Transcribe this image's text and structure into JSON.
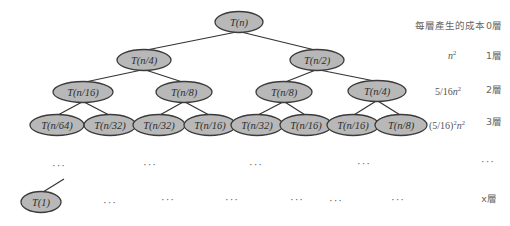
{
  "diagram": {
    "node_fill": "#b8b8b8",
    "node_stroke": "#3a3a3a",
    "edge_color": "#333333",
    "nodes": [
      {
        "id": "root",
        "label": "T(n)",
        "x": 239,
        "y": 22,
        "rx": 24,
        "ry": 10.5
      },
      {
        "id": "l1a",
        "label": "T(n/4)",
        "x": 144,
        "y": 60,
        "rx": 27,
        "ry": 10.5
      },
      {
        "id": "l1b",
        "label": "T(n/2)",
        "x": 317,
        "y": 60,
        "rx": 27,
        "ry": 10.5
      },
      {
        "id": "l2a",
        "label": "T(n/16)",
        "x": 83,
        "y": 92,
        "rx": 30,
        "ry": 10.5
      },
      {
        "id": "l2b",
        "label": "T(n/8)",
        "x": 184,
        "y": 92,
        "rx": 28,
        "ry": 10.5
      },
      {
        "id": "l2c",
        "label": "T(n/8)",
        "x": 284,
        "y": 92,
        "rx": 28,
        "ry": 10.5
      },
      {
        "id": "l2d",
        "label": "T(n/4)",
        "x": 377,
        "y": 91,
        "rx": 29,
        "ry": 10.5
      },
      {
        "id": "l3a",
        "label": "T(n/64)",
        "x": 57,
        "y": 125,
        "rx": 27,
        "ry": 10.5
      },
      {
        "id": "l3b",
        "label": "T(n/32)",
        "x": 110,
        "y": 125,
        "rx": 26,
        "ry": 10.5
      },
      {
        "id": "l3c",
        "label": "T(n/32)",
        "x": 159,
        "y": 125,
        "rx": 26,
        "ry": 10.5
      },
      {
        "id": "l3d",
        "label": "T(n/16)",
        "x": 210,
        "y": 125,
        "rx": 26,
        "ry": 10.5
      },
      {
        "id": "l3e",
        "label": "T(n/32)",
        "x": 257,
        "y": 125,
        "rx": 26,
        "ry": 10.5
      },
      {
        "id": "l3f",
        "label": "T(n/16)",
        "x": 306,
        "y": 125,
        "rx": 26,
        "ry": 10.5
      },
      {
        "id": "l3g",
        "label": "T(n/16)",
        "x": 353,
        "y": 125,
        "rx": 26,
        "ry": 10.5
      },
      {
        "id": "l3h",
        "label": "T(n/8)",
        "x": 401,
        "y": 125,
        "rx": 26,
        "ry": 10.5
      },
      {
        "id": "leaf",
        "label": "T(1)",
        "x": 41,
        "y": 202,
        "rx": 20,
        "ry": 10.5
      }
    ],
    "edges": [
      {
        "from": "root",
        "to": "l1a"
      },
      {
        "from": "root",
        "to": "l1b"
      },
      {
        "from": "l1a",
        "to": "l2a"
      },
      {
        "from": "l1a",
        "to": "l2b"
      },
      {
        "from": "l1b",
        "to": "l2c"
      },
      {
        "from": "l1b",
        "to": "l2d"
      },
      {
        "from": "l2a",
        "to": "l3a"
      },
      {
        "from": "l2a",
        "to": "l3b"
      },
      {
        "from": "l2b",
        "to": "l3c"
      },
      {
        "from": "l2b",
        "to": "l3d"
      },
      {
        "from": "l2c",
        "to": "l3e"
      },
      {
        "from": "l2c",
        "to": "l3f"
      },
      {
        "from": "l2d",
        "to": "l3g"
      },
      {
        "from": "l2d",
        "to": "l3h"
      }
    ],
    "leaf_edge": {
      "x1": 64,
      "y1": 179,
      "x2": 43,
      "y2": 192
    },
    "ellipsis_text": "···",
    "ellipsis_row1": [
      {
        "x": 59,
        "y": 169
      },
      {
        "x": 150,
        "y": 168
      },
      {
        "x": 256,
        "y": 168
      },
      {
        "x": 364,
        "y": 167
      },
      {
        "x": 488,
        "y": 165
      }
    ],
    "ellipsis_row2": [
      {
        "x": 110,
        "y": 206
      },
      {
        "x": 168,
        "y": 203
      },
      {
        "x": 232,
        "y": 203
      },
      {
        "x": 297,
        "y": 203
      },
      {
        "x": 336,
        "y": 204
      },
      {
        "x": 398,
        "y": 203
      }
    ]
  },
  "cost_column": {
    "header": "每層產生的成本",
    "rows": [
      {
        "cost_main": "n",
        "cost_sup": "2",
        "cost_prefix": "",
        "y": 56
      },
      {
        "cost_prefix": "5/16",
        "cost_main": "n",
        "cost_sup": "2",
        "y": 92
      },
      {
        "cost_prefix": "(5/16)",
        "cost_prefix_sup": "2",
        "cost_main": "n",
        "cost_sup": "2",
        "y": 126
      }
    ]
  },
  "level_column": {
    "labels": [
      {
        "text": "0層",
        "y": 26
      },
      {
        "text": "1層",
        "y": 56
      },
      {
        "text": "2層",
        "y": 90
      },
      {
        "text": "3層",
        "y": 122
      },
      {
        "text": "x層",
        "y": 199
      }
    ]
  }
}
